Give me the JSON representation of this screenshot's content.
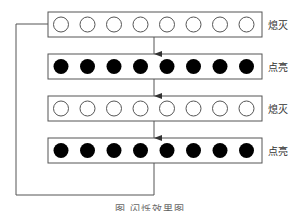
{
  "diagram": {
    "rows": [
      {
        "state": "off",
        "label": "熄灭",
        "led_count": 8
      },
      {
        "state": "on",
        "label": "点亮",
        "led_count": 8
      },
      {
        "state": "off",
        "label": "熄灭",
        "led_count": 8
      },
      {
        "state": "on",
        "label": "点亮",
        "led_count": 8
      }
    ],
    "loop": "last row returns to first row",
    "caption": "图   闪烁效果图",
    "colors": {
      "line": "#555555",
      "led_on": "#000000",
      "led_off_fill": "#ffffff",
      "led_off_stroke": "#555555"
    }
  }
}
